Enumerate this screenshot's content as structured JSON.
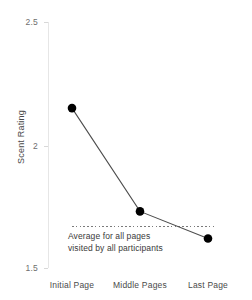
{
  "chart_data": {
    "type": "line",
    "title": "",
    "xlabel": "",
    "ylabel": "Scent Rating",
    "categories": [
      "Initial Page",
      "Middle Pages",
      "Last Page"
    ],
    "values": [
      2.15,
      1.73,
      1.62
    ],
    "series": [
      {
        "name": "Scent Rating",
        "values": [
          2.15,
          1.73,
          1.62
        ]
      }
    ],
    "ylim": [
      1.5,
      2.5
    ],
    "yticks": [
      "2.5",
      "2",
      "1.5"
    ],
    "ytick_values": [
      2.5,
      2,
      1.5
    ],
    "grid": false,
    "legend": "none",
    "marker": "filled-circle",
    "line_color": "#4d4d4d",
    "marker_color": "#000000",
    "reference_line": {
      "value": 1.67,
      "style": "dotted",
      "color": "#7a7a7a",
      "label_line1": "Average for all pages",
      "label_line2": "visited by all participants"
    },
    "axis_color": "#e6e6e6",
    "tick_label_color": "#6e6e6e",
    "background": "#ffffff"
  }
}
